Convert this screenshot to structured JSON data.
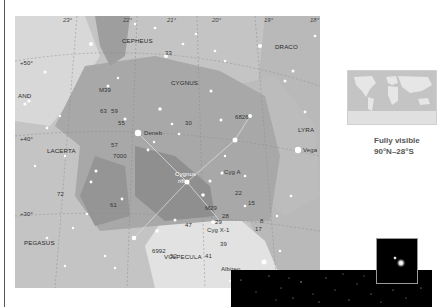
{
  "map": {
    "ra_ticks": [
      "23h",
      "22h",
      "21h",
      "20h",
      "19h",
      "18h"
    ],
    "ra_tick_labels": [
      "23°",
      "22°",
      "21°",
      "20°",
      "19°",
      "18°"
    ],
    "dec_ticks": [
      "+50°",
      "+40°",
      "+30°"
    ],
    "constellations": {
      "cepheus": "CEPHEUS",
      "draco": "DRACO",
      "cygnus": "CYGNUS",
      "andromeda": "AND",
      "lacerta": "LACERTA",
      "lyra": "LYRA",
      "pegasus": "PEGASUS",
      "vulpecula": "VULPECULA"
    },
    "objects": {
      "deneb": "Deneb",
      "vega": "Vega",
      "albireo": "Albireo",
      "cyg_a": "Cyg A",
      "cyg_x1": "Cyg X-1",
      "cygnus_rift_1": "Cygnus",
      "cygnus_rift_2": "rift",
      "m39": "M39",
      "m29": "M29",
      "ngc7000": "7000",
      "ngc6826": "6826",
      "ngc6992": "6992"
    },
    "star_numbers": [
      "33",
      "63",
      "59",
      "55",
      "57",
      "30",
      "72",
      "61",
      "47",
      "22",
      "15",
      "28",
      "29",
      "39",
      "41",
      "17",
      "52",
      "8"
    ],
    "greek": [
      "α",
      "β",
      "γ",
      "δ",
      "ε",
      "ζ",
      "η",
      "ι",
      "κ",
      "λ",
      "μ",
      "ν",
      "ξ",
      "π",
      "ρ",
      "σ",
      "τ",
      "υ",
      "χ"
    ]
  },
  "visibility": {
    "line1": "Fully visible",
    "line2": "90°N–28°S"
  },
  "colors": {
    "sky_light": "#d6d6d6",
    "sky_mid": "#bdbdbd",
    "cygnus_area": "#a9a9a9",
    "rift": "#8f8f8f",
    "milky_way": "#e4e4e4"
  }
}
